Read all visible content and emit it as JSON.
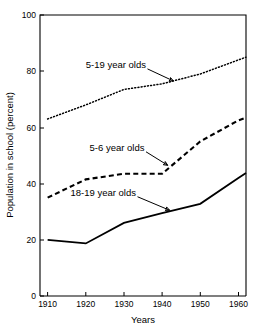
{
  "chart_data": {
    "type": "line",
    "title": "",
    "xlabel": "Years",
    "ylabel": "Population in school (percent)",
    "xlim": [
      1908,
      1962
    ],
    "ylim": [
      0,
      100
    ],
    "grid": false,
    "legend_position": "inline-annotations",
    "xticks": [
      1910,
      1920,
      1930,
      1940,
      1950,
      1960
    ],
    "xtick_labels": [
      "1910",
      "1920",
      "1930",
      "1940",
      "1950",
      "1960"
    ],
    "yticks": [
      0,
      20,
      40,
      60,
      80,
      100
    ],
    "ytick_labels": [
      "0",
      "20",
      "40",
      "60",
      "80",
      "100"
    ],
    "series": [
      {
        "name": "5-19 year olds",
        "style": "dotted",
        "color": "#000000",
        "x": [
          1910,
          1920,
          1930,
          1940,
          1950,
          1960,
          1962
        ],
        "values": [
          63,
          68,
          73.5,
          75.5,
          79,
          84,
          85
        ]
      },
      {
        "name": "5-6 year olds",
        "style": "dashed",
        "color": "#000000",
        "x": [
          1910,
          1920,
          1930,
          1940,
          1950,
          1960,
          1962
        ],
        "values": [
          35,
          41.5,
          43.5,
          43.5,
          55,
          62.5,
          63.5
        ]
      },
      {
        "name": "18-19 year olds",
        "style": "solid",
        "color": "#000000",
        "x": [
          1910,
          1920,
          1930,
          1940,
          1950,
          1960,
          1962
        ],
        "values": [
          20,
          18.7,
          26,
          29.5,
          32.8,
          42,
          43.8
        ]
      }
    ],
    "annotations": [
      {
        "text": "5-19 year olds",
        "target_x": 1943,
        "target_y": 76.5,
        "label_x": 1920,
        "label_y": 81
      },
      {
        "text": "5-6 year olds",
        "target_x": 1941.5,
        "target_y": 46.5,
        "label_x": 1921,
        "label_y": 51.5
      },
      {
        "text": "18-19 year olds",
        "target_x": 1942,
        "target_y": 30.5,
        "label_x": 1916,
        "label_y": 35.5
      }
    ]
  }
}
